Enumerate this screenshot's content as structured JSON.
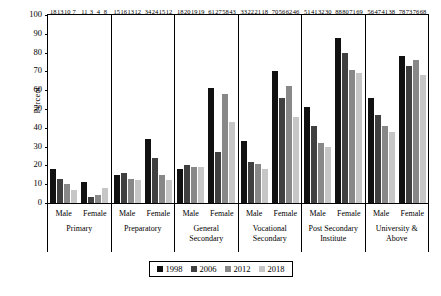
{
  "chart_data": {
    "type": "bar",
    "title": "",
    "xlabel": "",
    "ylabel": "Percent",
    "ylim": [
      0,
      100
    ],
    "ytick_step": 10,
    "yticks": [
      "100",
      "90",
      "80",
      "70",
      "60",
      "50",
      "40",
      "30",
      "20",
      "10",
      "0"
    ],
    "grid": false,
    "legend_position": "bottom-center",
    "series": [
      {
        "name": "1998",
        "color": "#111111"
      },
      {
        "name": "2006",
        "color": "#404040"
      },
      {
        "name": "2012",
        "color": "#888888"
      },
      {
        "name": "2018",
        "color": "#c6c6c6"
      }
    ],
    "sex_labels": [
      "Male",
      "Female"
    ],
    "categories": [
      {
        "name": "Primary",
        "name_lines": [
          "Primary"
        ],
        "Male": [
          18,
          13,
          10,
          7
        ],
        "Female": [
          11,
          3,
          4,
          8
        ]
      },
      {
        "name": "Preparatory",
        "name_lines": [
          "Preparatory"
        ],
        "Male": [
          15,
          16,
          13,
          12
        ],
        "Female": [
          34,
          24,
          15,
          12
        ]
      },
      {
        "name": "General Secondary",
        "name_lines": [
          "General",
          "Secondary"
        ],
        "Male": [
          18,
          20,
          19,
          19
        ],
        "Female": [
          61,
          27,
          58,
          43
        ]
      },
      {
        "name": "Vocational Secondary",
        "name_lines": [
          "Vocational",
          "Secondary"
        ],
        "Male": [
          33,
          22,
          21,
          18
        ],
        "Female": [
          70,
          56,
          62,
          46
        ]
      },
      {
        "name": "Post Secondary Institute",
        "name_lines": [
          "Post Secondary",
          "Institute"
        ],
        "Male": [
          51,
          41,
          32,
          30
        ],
        "Female": [
          88,
          80,
          71,
          69
        ]
      },
      {
        "name": "University & Above",
        "name_lines": [
          "University &",
          "Above"
        ],
        "Male": [
          56,
          47,
          41,
          38
        ],
        "Female": [
          78,
          73,
          76,
          68
        ]
      }
    ]
  }
}
